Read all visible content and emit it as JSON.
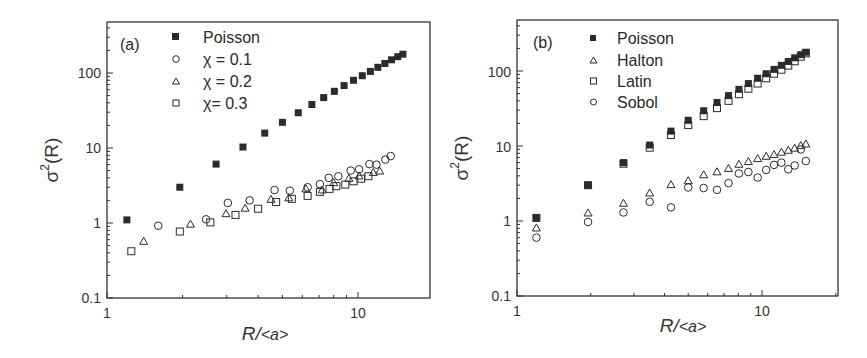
{
  "chart_data": [
    {
      "type": "scatter",
      "panel_label": "(a)",
      "title": "",
      "xlabel": "R/<a>",
      "ylabel": "σ²(R)",
      "xscale": "log",
      "yscale": "log",
      "xlim": [
        1,
        18
      ],
      "ylim": [
        0.1,
        500
      ],
      "xticks": [
        "1",
        "10"
      ],
      "yticks": [
        "0.1",
        "1",
        "10",
        "100"
      ],
      "grid": false,
      "legend_position": "upper left (inside)",
      "series": [
        {
          "name": "Poisson",
          "marker": "filled-square",
          "x": [
            1.2,
            1.95,
            2.72,
            3.48,
            4.25,
            5.0,
            5.78,
            6.55,
            7.3,
            8.05,
            8.8,
            9.6,
            10.4,
            11.2,
            12.0,
            12.8,
            13.6,
            14.4,
            15.1
          ],
          "y": [
            1.1,
            3.0,
            6.1,
            10.3,
            15.8,
            22.0,
            29.5,
            38.0,
            47.0,
            57.0,
            68.0,
            80.0,
            92.0,
            105.0,
            119.0,
            134.0,
            150.0,
            165.0,
            178.0
          ]
        },
        {
          "name": "χ = 0.1",
          "marker": "open-circle",
          "x": [
            1.6,
            2.48,
            3.03,
            3.7,
            4.65,
            5.35,
            6.3,
            7.05,
            7.65,
            8.35,
            9.35,
            10.1,
            11.1,
            11.85,
            12.85,
            13.5
          ],
          "y": [
            0.92,
            1.12,
            1.85,
            2.0,
            2.75,
            2.7,
            3.0,
            3.3,
            4.0,
            4.2,
            5.0,
            5.2,
            6.1,
            6.0,
            7.0,
            7.8
          ]
        },
        {
          "name": "χ = 0.2",
          "marker": "open-triangle",
          "x": [
            1.4,
            2.15,
            2.98,
            3.55,
            4.5,
            5.3,
            6.2,
            7.2,
            8.0,
            9.2,
            10.1,
            11.5,
            12.2
          ],
          "y": [
            0.58,
            0.98,
            1.35,
            1.6,
            2.1,
            2.2,
            2.9,
            2.8,
            3.5,
            4.0,
            4.3,
            4.8,
            5.0
          ]
        },
        {
          "name": "χ = 0.3",
          "marker": "open-square",
          "x": [
            1.25,
            1.95,
            2.58,
            3.25,
            4.0,
            4.72,
            5.45,
            6.3,
            7.05,
            7.7,
            8.2,
            8.9,
            9.6,
            10.3,
            11.0
          ],
          "y": [
            0.42,
            0.77,
            1.02,
            1.28,
            1.55,
            1.9,
            2.1,
            2.3,
            2.6,
            2.85,
            3.1,
            3.25,
            3.6,
            3.9,
            4.2
          ]
        }
      ]
    },
    {
      "type": "scatter",
      "panel_label": "(b)",
      "title": "",
      "xlabel": "R/<a>",
      "ylabel": "σ²(R)",
      "xscale": "log",
      "yscale": "log",
      "xlim": [
        1,
        20
      ],
      "ylim": [
        0.1,
        500
      ],
      "xticks": [
        "1",
        "10"
      ],
      "yticks": [
        "0.1",
        "1",
        "10",
        "100"
      ],
      "grid": false,
      "legend_position": "upper left (inside)",
      "series": [
        {
          "name": "Poisson",
          "marker": "filled-square",
          "x": [
            1.2,
            1.95,
            2.72,
            3.48,
            4.25,
            5.0,
            5.78,
            6.55,
            7.3,
            8.05,
            8.8,
            9.6,
            10.4,
            11.2,
            12.0,
            12.8,
            13.6,
            14.4,
            15.1
          ],
          "y": [
            1.1,
            3.0,
            6.0,
            10.3,
            15.8,
            22.0,
            29.5,
            38.0,
            47.0,
            57.0,
            68.0,
            80.0,
            92.0,
            105.0,
            119.0,
            134.0,
            150.0,
            165.0,
            178.0
          ]
        },
        {
          "name": "Halton",
          "marker": "open-triangle",
          "x": [
            1.2,
            1.95,
            2.72,
            3.48,
            4.25,
            5.0,
            5.78,
            6.55,
            7.3,
            8.05,
            8.8,
            9.6,
            10.4,
            11.2,
            12.0,
            12.8,
            13.6,
            14.4,
            15.1
          ],
          "y": [
            0.82,
            1.3,
            1.75,
            2.4,
            3.1,
            3.5,
            4.2,
            4.6,
            5.1,
            5.8,
            6.3,
            6.9,
            7.4,
            7.8,
            8.4,
            8.9,
            9.5,
            10.3,
            10.8
          ]
        },
        {
          "name": "Latin",
          "marker": "open-square",
          "x": [
            1.2,
            1.95,
            2.72,
            3.48,
            4.25,
            5.0,
            5.78,
            6.55,
            7.3,
            8.05,
            8.8,
            9.6,
            10.4,
            11.2,
            12.0,
            12.8,
            13.6,
            14.4,
            15.1
          ],
          "y": [
            1.1,
            3.0,
            5.8,
            9.5,
            14.0,
            19.0,
            25.0,
            32.0,
            40.0,
            49.0,
            58.0,
            68.0,
            80.0,
            92.0,
            104.0,
            118.0,
            135.0,
            155.0,
            172.0
          ]
        },
        {
          "name": "Sobol",
          "marker": "open-circle",
          "x": [
            1.2,
            1.95,
            2.72,
            3.48,
            4.25,
            5.0,
            5.78,
            6.55,
            7.3,
            8.05,
            8.8,
            9.6,
            10.4,
            11.2,
            12.0,
            12.8,
            13.6,
            14.4,
            15.1
          ],
          "y": [
            0.6,
            0.97,
            1.3,
            1.8,
            1.52,
            2.8,
            2.75,
            2.6,
            3.2,
            4.3,
            4.5,
            3.8,
            4.8,
            5.6,
            6.0,
            4.9,
            5.5,
            9.0,
            6.3
          ]
        }
      ]
    }
  ],
  "panels": [
    {
      "label": "(a)",
      "xlabel_main": "R/",
      "xlabel_angle": "<a>",
      "ylabel_sigma": "σ",
      "ylabel_sup": "2",
      "ylabel_rest": "(R)",
      "legend": [
        "Poisson",
        "χ = 0.1",
        "χ = 0.2",
        "χ= 0.3"
      ],
      "xtick_labels": [
        "1",
        "10"
      ],
      "ytick_labels": [
        "0.1",
        "1",
        "10",
        "100"
      ]
    },
    {
      "label": "(b)",
      "xlabel_main": "R/",
      "xlabel_angle": "<a>",
      "ylabel_sigma": "σ",
      "ylabel_sup": "2",
      "ylabel_rest": "(R)",
      "legend": [
        "Poisson",
        "Halton",
        "Latin",
        "Sobol"
      ],
      "xtick_labels": [
        "1",
        "10"
      ],
      "ytick_labels": [
        "0.1",
        "1",
        "10",
        "100"
      ]
    }
  ],
  "colors": {
    "marker": "#2b2b2b",
    "axis": "#333333",
    "text": "#2a2a2a"
  }
}
